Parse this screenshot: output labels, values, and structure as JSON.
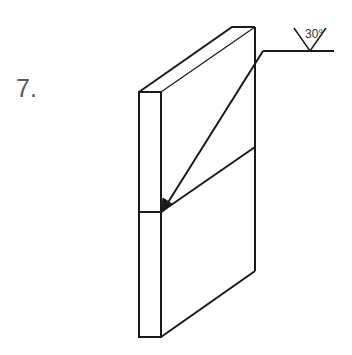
{
  "problem": {
    "number": "7."
  },
  "weld_symbol": {
    "type": "V-groove",
    "groove_angle": "30°",
    "arrow_side": true
  },
  "part": {
    "description": "Two plates butt-joined with an angled weld seam",
    "line_color": "#1a1a1a"
  }
}
